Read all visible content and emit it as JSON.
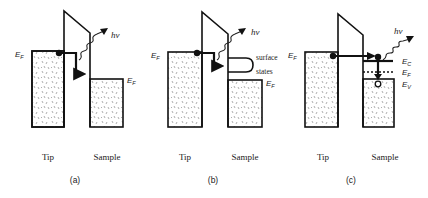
{
  "figure": {
    "panels": [
      {
        "id": "a",
        "caption": "(a)",
        "tip_label": "Tip",
        "sample_label": "Sample",
        "tip_fermi_label": "E",
        "tip_fermi_sub": "F",
        "sample_fermi_label": "E",
        "sample_fermi_sub": "F",
        "photon_label": "hν",
        "description": "Electron tunnels elastically from tip Fermi level into sample, loses energy and emits photon"
      },
      {
        "id": "b",
        "caption": "(b)",
        "tip_label": "Tip",
        "sample_label": "Sample",
        "tip_fermi_label": "E",
        "tip_fermi_sub": "F",
        "sample_fermi_label": "E",
        "sample_fermi_sub": "F",
        "surface_states_line1": "surface",
        "surface_states_line2": "states",
        "photon_label": "hν",
        "description": "Electron tunnels into surface states and emits photon"
      },
      {
        "id": "c",
        "caption": "(c)",
        "tip_label": "Tip",
        "sample_label": "Sample",
        "tip_fermi_label": "E",
        "tip_fermi_sub": "F",
        "ec_label": "E",
        "ec_sub": "C",
        "ef_label": "E",
        "ef_sub": "F",
        "ev_label": "E",
        "ev_sub": "V",
        "photon_label": "hν",
        "description": "Electron injected into conduction band recombines with hole in valence band emitting photon"
      }
    ]
  }
}
